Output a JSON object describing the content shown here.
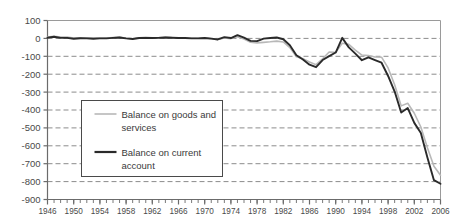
{
  "chart_data": {
    "type": "line",
    "title": "",
    "subtitle": "",
    "xlabel": "",
    "ylabel": "",
    "xlim": [
      1946,
      2006
    ],
    "ylim": [
      -900,
      100
    ],
    "y_ticks": [
      100,
      0,
      -100,
      -200,
      -300,
      -400,
      -500,
      -600,
      -700,
      -800,
      -900
    ],
    "y_tick_labels": [
      "100",
      "0",
      "-100",
      "-200",
      "-300",
      "-400",
      "-500",
      "-600",
      "-700",
      "-800",
      "-900"
    ],
    "x_ticks": [
      1946,
      1950,
      1954,
      1958,
      1962,
      1966,
      1970,
      1974,
      1978,
      1982,
      1986,
      1990,
      1994,
      1998,
      2002,
      2006
    ],
    "x_tick_labels": [
      "1946",
      "1950",
      "1954",
      "1958",
      "1962",
      "1966",
      "1970",
      "1974",
      "1978",
      "1982",
      "1986",
      "1990",
      "1994",
      "1998",
      "2002",
      "2006"
    ],
    "x_minor_tick_interval": 1,
    "grid": "horizontal-dashed",
    "grid_color": "#8c8c8c",
    "legend_position": "lower-left-inside",
    "x": [
      1946,
      1947,
      1948,
      1949,
      1950,
      1951,
      1952,
      1953,
      1954,
      1955,
      1956,
      1957,
      1958,
      1959,
      1960,
      1961,
      1962,
      1963,
      1964,
      1965,
      1966,
      1967,
      1968,
      1969,
      1970,
      1971,
      1972,
      1973,
      1974,
      1975,
      1976,
      1977,
      1978,
      1979,
      1980,
      1981,
      1982,
      1983,
      1984,
      1985,
      1986,
      1987,
      1988,
      1989,
      1990,
      1991,
      1992,
      1993,
      1994,
      1995,
      1996,
      1997,
      1998,
      1999,
      2000,
      2001,
      2002,
      2003,
      2004,
      2005,
      2006
    ],
    "series": [
      {
        "name": "Balance on goods and services",
        "color": "#b8b8b8",
        "width": 1.6,
        "values": [
          8,
          12,
          7,
          7,
          2,
          4,
          3,
          2,
          2,
          2,
          5,
          7,
          1,
          -2,
          4,
          6,
          4,
          5,
          7,
          5,
          4,
          4,
          1,
          1,
          3,
          -2,
          -6,
          2,
          -1,
          9,
          -3,
          -21,
          -25,
          -22,
          -19,
          -15,
          -20,
          -51,
          -102,
          -113,
          -132,
          -147,
          -114,
          -76,
          -78,
          -27,
          -33,
          -65,
          -93,
          -96,
          -104,
          -105,
          -165,
          -259,
          -377,
          -362,
          -418,
          -495,
          -611,
          -714,
          -765
        ]
      },
      {
        "name": "Balance on current account",
        "color": "#2a2a2a",
        "width": 1.9,
        "values": [
          4,
          9,
          3,
          3,
          -2,
          1,
          0,
          -2,
          0,
          0,
          3,
          5,
          0,
          -3,
          2,
          3,
          2,
          3,
          5,
          4,
          2,
          2,
          0,
          0,
          2,
          -1,
          -6,
          7,
          2,
          18,
          4,
          -14,
          -15,
          -1,
          2,
          5,
          -5,
          -38,
          -94,
          -118,
          -147,
          -161,
          -121,
          -99,
          -79,
          3,
          -50,
          -85,
          -122,
          -106,
          -121,
          -136,
          -210,
          -297,
          -414,
          -389,
          -472,
          -528,
          -665,
          -792,
          -812
        ]
      }
    ]
  },
  "legend": {
    "items": [
      {
        "label_line1": "Balance on goods and",
        "label_line2": "services",
        "swatch_color": "#b8b8b8",
        "swatch_width": 1.6
      },
      {
        "label_line1": "Balance on current",
        "label_line2": "account",
        "swatch_color": "#2a2a2a",
        "swatch_width": 2.2
      }
    ]
  },
  "axis": {
    "axis_color": "#6b6b6b",
    "tick_color": "#6b6b6b"
  }
}
